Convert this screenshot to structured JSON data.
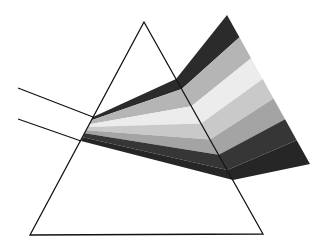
{
  "title": "Dispersion of light through a prism",
  "colors": {
    "background": "#ffffff",
    "outline": "#111111",
    "bands": [
      "#2b2b2b",
      "#b5b5b5",
      "#ececec",
      "#c9c9c9",
      "#a4a4a4",
      "#363636",
      "#262626"
    ]
  },
  "prism": {
    "apex": [
      144,
      22
    ],
    "bottom_left": [
      30,
      235
    ],
    "bottom_right": [
      263,
      234
    ]
  },
  "incident_rays": [
    {
      "from": [
        18,
        88
      ],
      "to": [
        93,
        117
      ]
    },
    {
      "from": [
        18,
        119
      ],
      "to": [
        81,
        141
      ]
    }
  ],
  "band_count": 7
}
